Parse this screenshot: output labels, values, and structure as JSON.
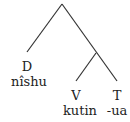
{
  "diagram": {
    "type": "syntax-tree",
    "line_color": "#333333",
    "nodes": [
      {
        "id": "root",
        "category": "",
        "word": ""
      },
      {
        "id": "d",
        "category": "D",
        "word": "nîshu"
      },
      {
        "id": "inner",
        "category": "",
        "word": ""
      },
      {
        "id": "v",
        "category": "V",
        "word": "kutin"
      },
      {
        "id": "t",
        "category": "T",
        "word": "-ua"
      }
    ],
    "edges": [
      [
        "root",
        "d"
      ],
      [
        "root",
        "inner"
      ],
      [
        "inner",
        "v"
      ],
      [
        "inner",
        "t"
      ]
    ],
    "labels": {
      "d_cat": "D",
      "d_word": "nîshu",
      "v_cat": "V",
      "v_word": "kutin",
      "t_cat": "T",
      "t_word": "-ua"
    }
  }
}
